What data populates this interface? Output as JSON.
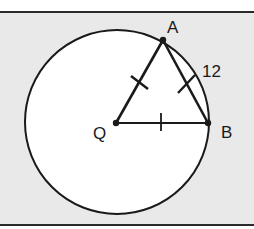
{
  "diagram": {
    "type": "geometry",
    "colors": {
      "background": "#e9e9e9",
      "circle_fill": "#ffffff",
      "stroke": "#1a1a1a"
    },
    "circle": {
      "center": "Q",
      "cx": 117,
      "cy": 122,
      "r": 92
    },
    "points": [
      {
        "name": "A",
        "label": "A",
        "x": 163,
        "y": 40
      },
      {
        "name": "Q",
        "label": "Q",
        "x": 116,
        "y": 123
      },
      {
        "name": "B",
        "label": "B",
        "x": 208,
        "y": 123
      }
    ],
    "segments": [
      {
        "from": "Q",
        "to": "A",
        "tick_marks": 1
      },
      {
        "from": "A",
        "to": "B",
        "tick_marks": 1,
        "length_label": "12"
      },
      {
        "from": "Q",
        "to": "B",
        "tick_marks": 1
      }
    ],
    "labels": {
      "A": "A",
      "Q": "Q",
      "B": "B",
      "AB_length": "12"
    }
  }
}
